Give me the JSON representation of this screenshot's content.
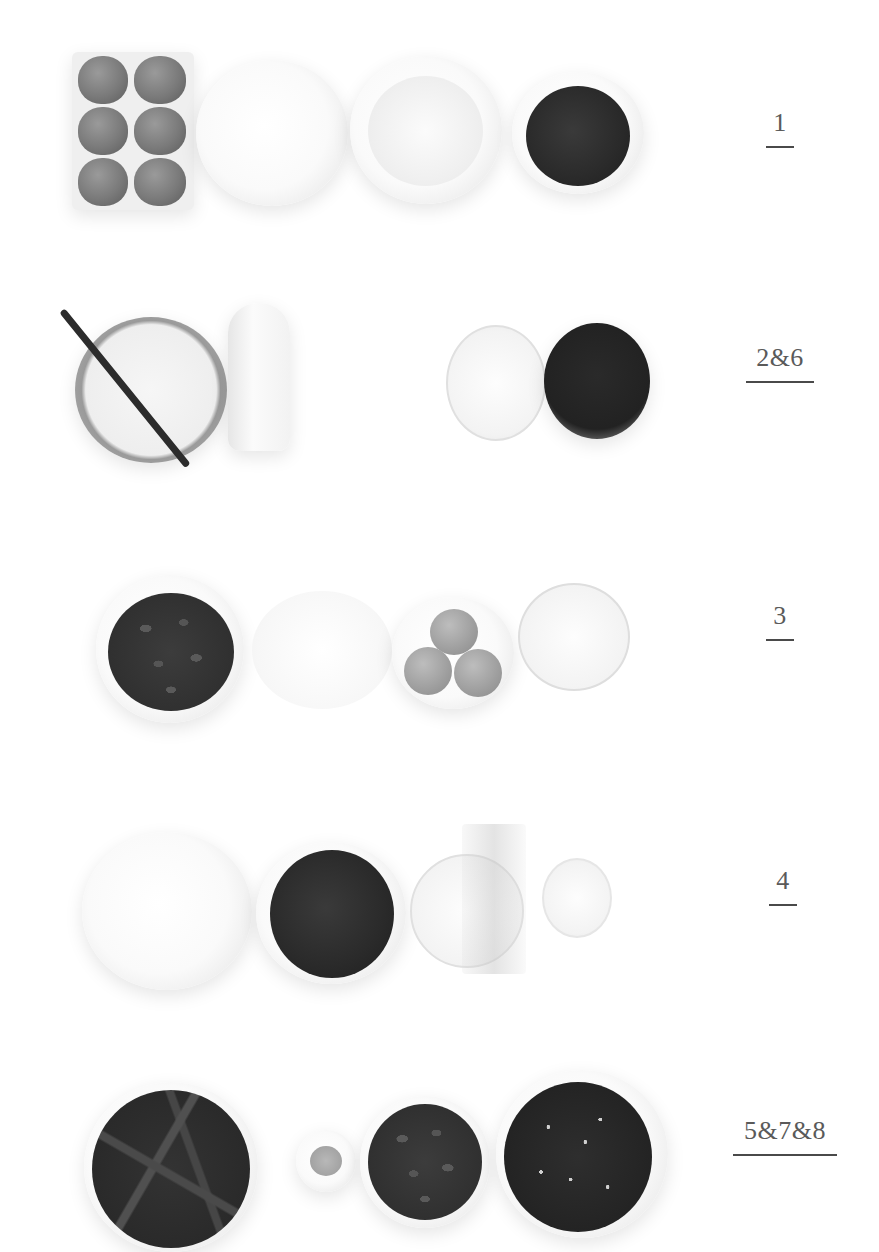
{
  "page": {
    "background": "#ffffff",
    "ink_color": "#4a4a4a"
  },
  "rows": [
    {
      "step_label": "1",
      "items": [
        "egg-carton-six-eggs",
        "bowl-sugar",
        "bowl-flour",
        "bowl-cocoa-powder"
      ]
    },
    {
      "step_label": "2&6",
      "items": [
        "bowl-sugar-with-vanilla-pod",
        "milk-bottle",
        "glass-water",
        "glass-dark-liquid"
      ]
    },
    {
      "step_label": "3",
      "items": [
        "bowl-chocolate-pistoles",
        "bowl-white",
        "bowl-egg-yolks",
        "glass-cream"
      ]
    },
    {
      "step_label": "4",
      "items": [
        "bowl-sugar",
        "bowl-cocoa-powder",
        "glass-water-with-gelatin",
        "glass-cream"
      ]
    },
    {
      "step_label": "5&7&8",
      "items": [
        "bowl-chocolate-shavings",
        "small-bowl-spice",
        "bowl-chocolate-pistoles",
        "bowl-cocoa-beans"
      ]
    }
  ]
}
